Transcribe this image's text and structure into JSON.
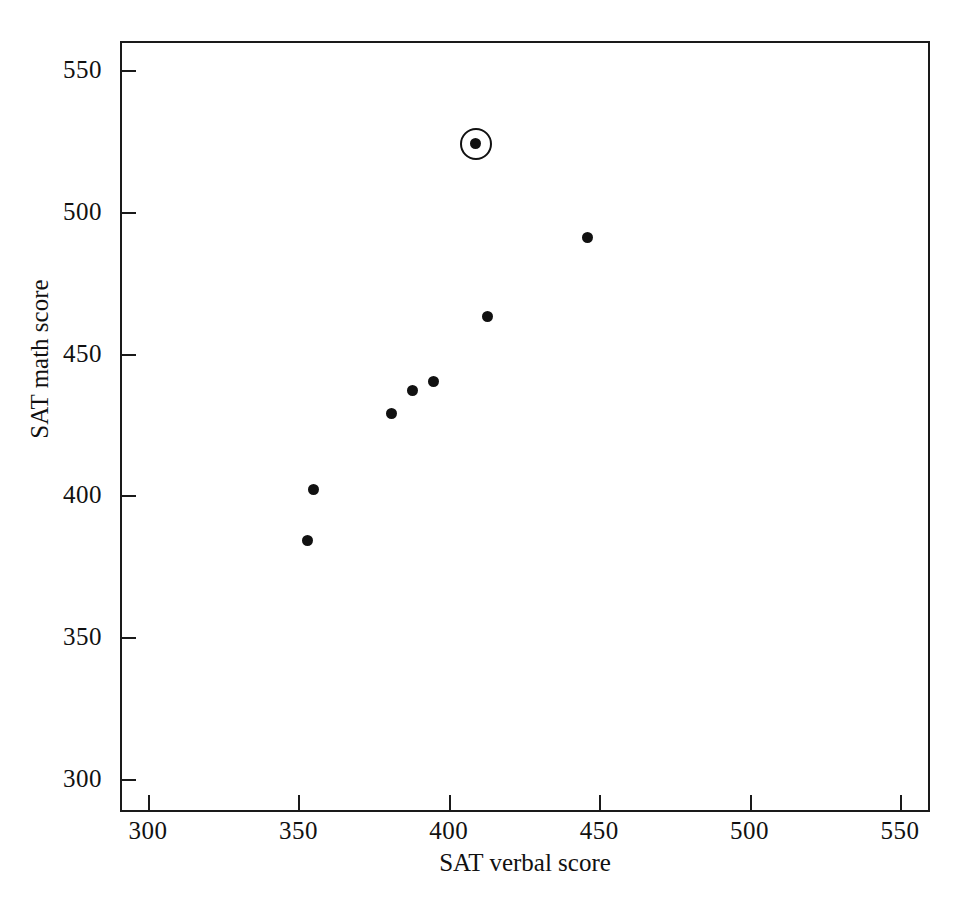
{
  "chart_data": {
    "type": "scatter",
    "title": "",
    "xlabel": "SAT verbal score",
    "ylabel": "SAT math score",
    "xlim": [
      290,
      560
    ],
    "ylim": [
      288,
      560
    ],
    "xticks": [
      300,
      350,
      400,
      450,
      500,
      550
    ],
    "yticks": [
      300,
      350,
      400,
      450,
      500,
      550
    ],
    "xtick_labels": [
      "300",
      "350",
      "400",
      "450",
      "500",
      "550"
    ],
    "ytick_labels": [
      "300",
      "350",
      "400",
      "450",
      "500",
      "550"
    ],
    "grid": false,
    "legend": "none",
    "series": [
      {
        "name": "schools",
        "points": [
          {
            "x": 353,
            "y": 384,
            "highlighted": false
          },
          {
            "x": 355,
            "y": 402,
            "highlighted": false
          },
          {
            "x": 381,
            "y": 429,
            "highlighted": false
          },
          {
            "x": 388,
            "y": 437,
            "highlighted": false
          },
          {
            "x": 395,
            "y": 440,
            "highlighted": false
          },
          {
            "x": 409,
            "y": 524,
            "highlighted": true
          },
          {
            "x": 413,
            "y": 463,
            "highlighted": false
          },
          {
            "x": 446,
            "y": 491,
            "highlighted": false
          }
        ]
      }
    ],
    "annotations": [
      {
        "type": "circle-marker",
        "x": 409,
        "y": 524,
        "note": "circled outlier point"
      }
    ],
    "colors": {
      "axis": "#1a1a1a",
      "point": "#111111",
      "background": "#ffffff"
    }
  }
}
